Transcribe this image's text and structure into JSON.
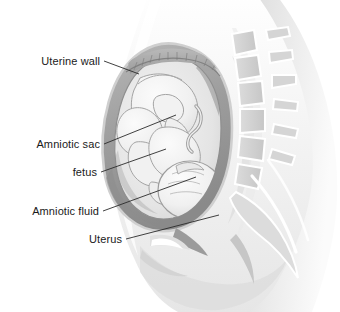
{
  "figure": {
    "background_color": "#ffffff",
    "label_color": "#1a1a1a",
    "leader_line_color": "#2b2b2b"
  },
  "labels": [
    {
      "id": "uterine-wall",
      "text": "Uterine wall",
      "text_anchor_x": 100,
      "text_anchor_y": 61,
      "leader": {
        "x1": 104,
        "y1": 61,
        "x2": 139,
        "y2": 74
      }
    },
    {
      "id": "amniotic-sac",
      "text": "Amniotic sac",
      "text_anchor_x": 100,
      "text_anchor_y": 144,
      "leader": {
        "x1": 104,
        "y1": 144,
        "x2": 176,
        "y2": 115
      }
    },
    {
      "id": "fetus",
      "text": "fetus",
      "text_anchor_x": 97,
      "text_anchor_y": 172,
      "leader": {
        "x1": 101,
        "y1": 172,
        "x2": 166,
        "y2": 149
      }
    },
    {
      "id": "amniotic-fluid",
      "text": "Amniotic fluid",
      "text_anchor_x": 99,
      "text_anchor_y": 211,
      "leader": {
        "x1": 103,
        "y1": 211,
        "x2": 196,
        "y2": 177
      }
    },
    {
      "id": "uterus",
      "text": "Uterus",
      "text_anchor_x": 122,
      "text_anchor_y": 239,
      "leader": {
        "x1": 126,
        "y1": 239,
        "x2": 219,
        "y2": 215
      }
    }
  ],
  "anatomy": {
    "parts": [
      "maternal-body-silhouette",
      "lumbar-spine",
      "sacrum",
      "uterus",
      "uterine-wall",
      "placenta",
      "amniotic-sac",
      "amniotic-fluid",
      "fetus",
      "umbilical-cord",
      "bladder",
      "pubic-bone",
      "rectum"
    ]
  },
  "palette": {
    "skin_light": "#f2f2f2",
    "skin_mid": "#e2e2e2",
    "skin_shadow": "#cdcdcd",
    "bone_fill": "#d9d9d9",
    "bone_outline": "#ffffff",
    "uterus_wall": "#a8a8a8",
    "uterus_wall_dark": "#8d8d8d",
    "amniotic_fluid": "#e9e9e9",
    "fetus_fill": "#f4f4f4",
    "fetus_line": "#9a9a9a",
    "placenta": "#b4b4b4"
  }
}
